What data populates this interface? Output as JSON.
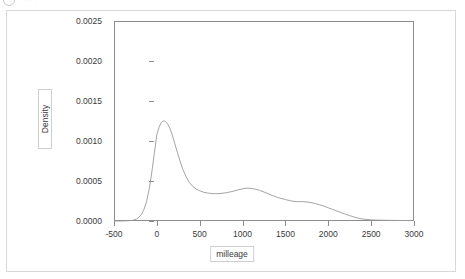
{
  "topbar": {
    "icon": "circle-icon",
    "title": "····"
  },
  "chart_data": {
    "type": "line",
    "title": "",
    "subtitle": "",
    "xlabel": "milleage",
    "ylabel": "Density",
    "xlim": [
      -500,
      3000
    ],
    "ylim": [
      0.0,
      0.0025
    ],
    "xticks": [
      -500,
      0,
      500,
      1000,
      1500,
      2000,
      2500,
      3000
    ],
    "xticklabels": [
      "-500",
      "0",
      "500",
      "1000",
      "1500",
      "2000",
      "2500",
      "3000"
    ],
    "yticks": [
      0.0,
      0.0005,
      0.001,
      0.0015,
      0.002,
      0.0025
    ],
    "yticklabels": [
      "0.0000",
      "0.0005",
      "0.0010",
      "0.0015",
      "0.0020",
      "0.0025"
    ],
    "grid": false,
    "legend": false,
    "line_color": "#9a9a9a",
    "frame_color": "#8c8c8c",
    "series": [
      {
        "name": "Density",
        "x": [
          -500,
          -450,
          -400,
          -350,
          -300,
          -270,
          -240,
          -210,
          -180,
          -150,
          -120,
          -90,
          -60,
          -30,
          0,
          25,
          50,
          75,
          100,
          125,
          150,
          180,
          210,
          240,
          270,
          300,
          340,
          380,
          420,
          460,
          500,
          550,
          600,
          650,
          700,
          750,
          800,
          850,
          900,
          950,
          1000,
          1050,
          1100,
          1150,
          1200,
          1250,
          1300,
          1350,
          1400,
          1450,
          1500,
          1550,
          1600,
          1650,
          1700,
          1750,
          1800,
          1850,
          1900,
          1950,
          2000,
          2050,
          2100,
          2150,
          2200,
          2250,
          2300,
          2350,
          2400,
          2500,
          2600,
          2700,
          2800,
          2900,
          3000
        ],
        "y": [
          0.0,
          0.0,
          0.0,
          2e-06,
          6e-06,
          1.2e-05,
          2.4e-05,
          4.5e-05,
          8.2e-05,
          0.000145,
          0.000245,
          0.000395,
          0.0006,
          0.000845,
          0.00108,
          0.00117,
          0.00123,
          0.001252,
          0.001245,
          0.001215,
          0.001165,
          0.001075,
          0.000965,
          0.000855,
          0.00075,
          0.000655,
          0.000555,
          0.00048,
          0.00043,
          0.000398,
          0.000378,
          0.000358,
          0.000348,
          0.000343,
          0.000341,
          0.000345,
          0.000352,
          0.000362,
          0.000375,
          0.00039,
          0.000402,
          0.00041,
          0.000408,
          0.000398,
          0.000382,
          0.000362,
          0.00034,
          0.000318,
          0.000298,
          0.000282,
          0.000268,
          0.000255,
          0.000245,
          0.000242,
          0.000242,
          0.000238,
          0.00023,
          0.000218,
          0.000202,
          0.000185,
          0.000165,
          0.000145,
          0.000125,
          0.000105,
          8.5e-05,
          6.7e-05,
          5e-05,
          3.6e-05,
          2.5e-05,
          1.4e-05,
          1e-05,
          8e-06,
          7e-06,
          6e-06,
          5e-06
        ]
      }
    ]
  }
}
